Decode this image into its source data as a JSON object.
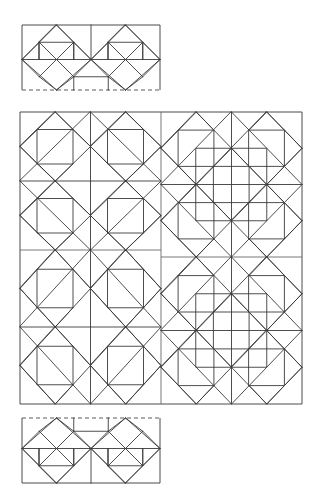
{
  "document": {
    "kind": "quilt-pattern-diagram",
    "title": "Quilt Block Layout Diagram",
    "canvas": {
      "width": 316,
      "height": 489,
      "background": "#ffffff"
    },
    "line_color": "#3a3a3a",
    "frame_color": "#4a4a4a",
    "dash_color": "#5a5a5a",
    "line_width": 0.9
  },
  "panels": [
    {
      "id": "top-border-strip",
      "label": "Top border strip",
      "x": 22,
      "y": 25,
      "width": 138,
      "height": 65,
      "block_size": 69,
      "rows": 1,
      "cols": 2,
      "clip_fraction_vertical": 0.94,
      "edges": {
        "top": "solid",
        "left": "solid",
        "right": "solid",
        "bottom": "dashed"
      },
      "blocks": [
        {
          "variant": "diamond-center",
          "row": 0,
          "col": 0,
          "rotation": 0
        },
        {
          "variant": "diamond-center",
          "row": 0,
          "col": 1,
          "rotation": 0
        }
      ]
    },
    {
      "id": "main-grid",
      "label": "Main 2 by 2 block grid",
      "x": 20,
      "y": 112,
      "width": 282,
      "height": 292,
      "block_size": 141,
      "rows": 2,
      "cols": 2,
      "edges": {
        "top": "solid",
        "left": "solid",
        "right": "solid",
        "bottom": "solid"
      },
      "dividers": {
        "vertical_x": 161,
        "horizontal_left_y": 250,
        "horizontal_right_y": 257
      },
      "blocks": [
        {
          "variant": "diamond-center",
          "row": 0,
          "col": 0,
          "rotation": 0
        },
        {
          "variant": "square-center",
          "row": 0,
          "col": 1,
          "rotation": 0
        },
        {
          "variant": "diamond-center",
          "row": 1,
          "col": 0,
          "rotation": 0
        },
        {
          "variant": "square-center",
          "row": 1,
          "col": 1,
          "rotation": 0
        }
      ]
    },
    {
      "id": "bottom-border-strip",
      "label": "Bottom border strip",
      "x": 22,
      "y": 418,
      "width": 138,
      "height": 65,
      "block_size": 69,
      "rows": 1,
      "cols": 2,
      "clip_fraction_vertical": 0.94,
      "edges": {
        "top": "dashed",
        "left": "solid",
        "right": "solid",
        "bottom": "solid"
      },
      "blocks": [
        {
          "variant": "diamond-center",
          "row": 0,
          "col": 0,
          "rotation": 180
        },
        {
          "variant": "diamond-center",
          "row": 0,
          "col": 1,
          "rotation": 180
        }
      ]
    }
  ],
  "unit_geometry": {
    "description": "Each block is a 2x2 arrangement of a square-in-square unit. Each unit contains an inscribed diamond (corner midpoints), a half-size inner square offset to one corner, and diagonal spokes forming triangles.",
    "unit_size": 70.5,
    "unit_features": [
      "outer-square",
      "inscribed-diamond",
      "inner-offset-square",
      "corner-diagonals"
    ]
  },
  "chart_data": {
    "type": "table",
    "categories": [
      "top-border-strip",
      "main-grid",
      "bottom-border-strip"
    ],
    "values": [
      2,
      4,
      2
    ],
    "xlabel": "Panel",
    "ylabel": "Block count"
  }
}
